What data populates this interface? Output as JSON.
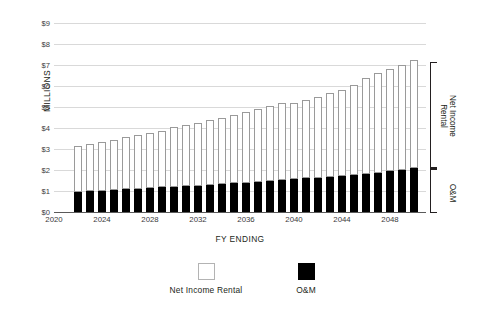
{
  "chart_data": {
    "type": "bar",
    "subtype": "stacked-bar",
    "title": "",
    "xlabel": "FY ENDING",
    "ylabel": "MILLIONS",
    "ylim": [
      0,
      9
    ],
    "ytick_values": [
      0,
      1,
      2,
      3,
      4,
      5,
      6,
      7,
      8,
      9
    ],
    "ytick_labels": [
      "$0",
      "$1",
      "$2",
      "$3",
      "$4",
      "$5",
      "$6",
      "$7",
      "$8",
      "$9"
    ],
    "xlim": [
      2020.0,
      2051.0
    ],
    "xtick_values": [
      2020,
      2024,
      2028,
      2032,
      2036,
      2040,
      2044,
      2048
    ],
    "xtick_labels": [
      "2020",
      "2024",
      "2028",
      "2032",
      "2036",
      "2040",
      "2044",
      "2048"
    ],
    "grid": "horizontal",
    "legend_position": "bottom-center",
    "categories": [
      2022,
      2023,
      2024,
      2025,
      2026,
      2027,
      2028,
      2029,
      2030,
      2031,
      2032,
      2033,
      2034,
      2035,
      2036,
      2037,
      2038,
      2039,
      2040,
      2041,
      2042,
      2043,
      2044,
      2045,
      2046,
      2047,
      2048,
      2049,
      2050
    ],
    "series": [
      {
        "name": "O&M",
        "color": "#000000",
        "values": [
          0.95,
          0.98,
          1.01,
          1.05,
          1.08,
          1.11,
          1.14,
          1.17,
          1.2,
          1.23,
          1.26,
          1.29,
          1.33,
          1.37,
          1.4,
          1.44,
          1.48,
          1.52,
          1.56,
          1.6,
          1.64,
          1.68,
          1.73,
          1.78,
          1.83,
          1.88,
          1.94,
          2.0,
          2.1
        ]
      },
      {
        "name": "Net Income Rental",
        "color": "#ffffff",
        "edge_color": "#9a9a9a",
        "values": [
          2.2,
          2.27,
          2.33,
          2.39,
          2.49,
          2.57,
          2.64,
          2.71,
          2.83,
          2.89,
          2.96,
          3.09,
          3.15,
          3.25,
          3.36,
          3.46,
          3.58,
          3.66,
          3.62,
          3.72,
          3.85,
          3.99,
          4.1,
          4.26,
          4.55,
          4.72,
          4.85,
          4.98,
          5.12
        ]
      }
    ],
    "totals": [
      3.15,
      3.25,
      3.34,
      3.44,
      3.57,
      3.68,
      3.78,
      3.88,
      4.03,
      4.12,
      4.22,
      4.38,
      4.48,
      4.62,
      4.76,
      4.9,
      5.06,
      5.18,
      5.18,
      5.32,
      5.49,
      5.67,
      5.83,
      6.04,
      6.38,
      6.6,
      6.79,
      6.98,
      7.22
    ],
    "annotations": [
      {
        "name": "bracket-net-income-rental",
        "label": "Net Income\nRental",
        "span": [
          2.1,
          7.25
        ]
      },
      {
        "name": "bracket-om",
        "label": "O&M",
        "span": [
          0.0,
          2.1
        ]
      }
    ]
  },
  "axes": {
    "y_title": "MILLIONS",
    "x_title": "FY ENDING"
  },
  "bracket": {
    "net_income_rental": "Net Income\nRental",
    "om": "O&M"
  },
  "legend": {
    "items": [
      {
        "label": "Net Income Rental",
        "swatch": "open-square"
      },
      {
        "label": "O&M",
        "swatch": "solid-square"
      }
    ]
  }
}
